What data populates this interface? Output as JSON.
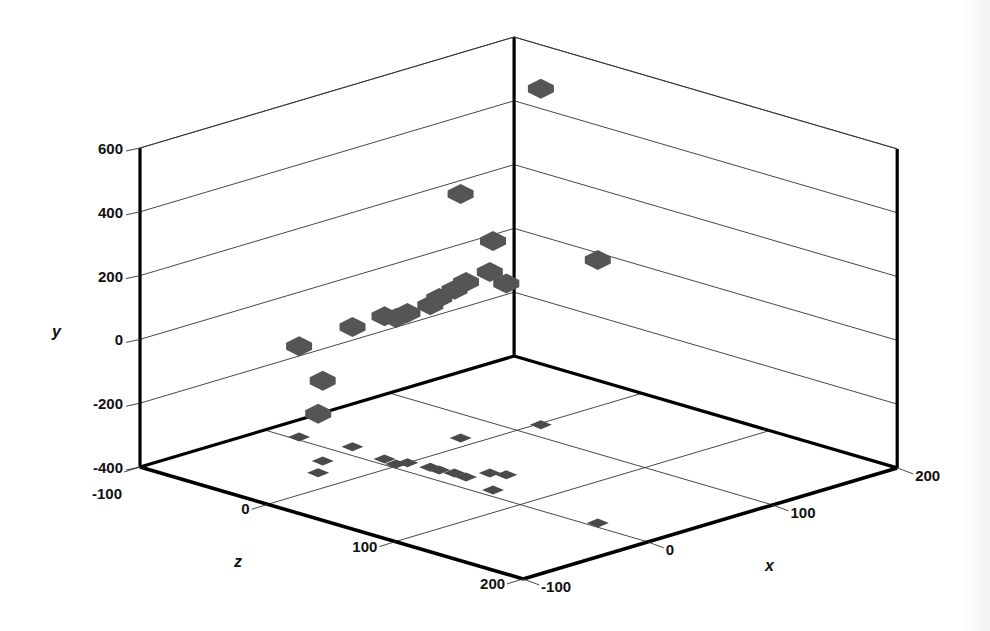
{
  "chart_data": {
    "type": "scatter",
    "subtype": "3d-scatter-with-floor-shadows",
    "title": "",
    "xlabel": "x",
    "ylabel": "y",
    "zlabel": "z",
    "xlim": [
      -100,
      200
    ],
    "ylim": [
      -400,
      600
    ],
    "zlim": [
      -100,
      200
    ],
    "x_ticks": [
      -100,
      0,
      100,
      200
    ],
    "y_ticks": [
      -400,
      -200,
      0,
      200,
      400,
      600
    ],
    "z_ticks": [
      -100,
      0,
      100,
      200
    ],
    "x_tick_labels": [
      "-100",
      "0",
      "100",
      "200"
    ],
    "y_tick_labels": [
      "-400",
      "-200",
      "0",
      "200",
      "400",
      "600"
    ],
    "z_tick_labels": [
      "-100",
      "0",
      "100",
      "200"
    ],
    "grid": true,
    "legend": null,
    "marker": {
      "shape": "hexagon",
      "color": "#555555",
      "shadow_color": "#4a4a4a"
    },
    "points": [
      {
        "x": 117,
        "y": 653,
        "z": 2
      },
      {
        "x": 67,
        "y": 365,
        "z": -12
      },
      {
        "x": 9,
        "y": 381,
        "z": 70
      },
      {
        "x": 6,
        "y": 424,
        "z": 155
      },
      {
        "x": 35,
        "y": 200,
        "z": 55
      },
      {
        "x": 31,
        "y": 230,
        "z": 46
      },
      {
        "x": 16,
        "y": 211,
        "z": 42
      },
      {
        "x": 17,
        "y": 174,
        "z": 32
      },
      {
        "x": 15,
        "y": 139,
        "z": 22
      },
      {
        "x": 15,
        "y": 108,
        "z": 15
      },
      {
        "x": 12,
        "y": 70,
        "z": 0
      },
      {
        "x": 6,
        "y": 58,
        "z": -3
      },
      {
        "x": 8,
        "y": 48,
        "z": -14
      },
      {
        "x": 12,
        "y": -24,
        "z": -43
      },
      {
        "x": 4,
        "y": -115,
        "z": -77
      },
      {
        "x": -19,
        "y": -149,
        "z": -36
      },
      {
        "x": -37,
        "y": -215,
        "z": -22
      }
    ]
  },
  "axes": {
    "x_title": "x",
    "y_title": "y",
    "z_title": "z"
  },
  "colors": {
    "background": "#ffffff",
    "axis_line": "#000000",
    "grid_line": "#333333",
    "marker": "#555555"
  }
}
